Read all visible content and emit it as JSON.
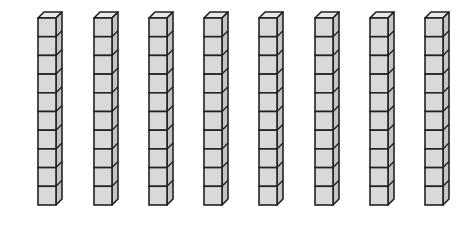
{
  "diagram": {
    "title": "",
    "rods": 8,
    "cubes_per_rod": 10,
    "total_value": 80,
    "rod_x_positions": [
      38,
      94,
      149,
      204,
      259,
      315,
      370,
      425
    ],
    "top_y": 18,
    "cube_width": 18,
    "cube_height": 18.7,
    "depth_x": 6,
    "depth_y": 6,
    "colors": {
      "front": "#d9d9d9",
      "side": "#c4c4c4",
      "top": "#e8e8e8",
      "stroke": "#222222"
    }
  }
}
